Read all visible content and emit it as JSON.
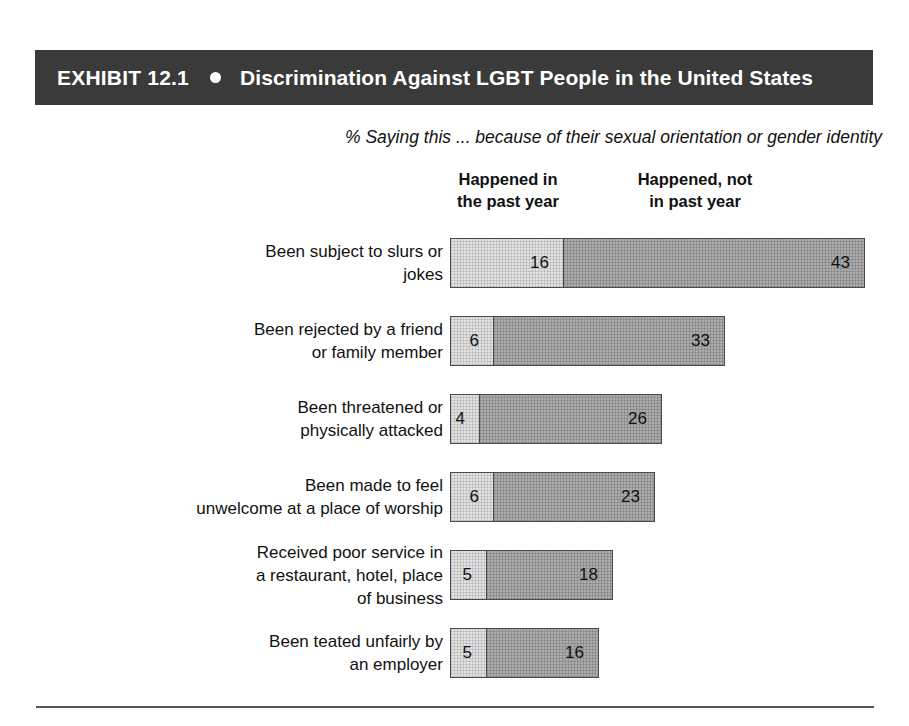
{
  "header": {
    "exhibit_label": "EXHIBIT 12.1",
    "bullet_icon": "bullet-dot-icon",
    "title": "Discrimination Against LGBT People in the United States",
    "bar_color": "#3a3a3a",
    "text_color": "#ffffff"
  },
  "subtitle": "% Saying this ... because of their sexual orientation or gender identity",
  "columns": [
    {
      "line1": "Happened in",
      "line2": "the past year"
    },
    {
      "line1": "Happened, not",
      "line2": "in past year"
    }
  ],
  "chart_data": {
    "type": "bar",
    "title": "Discrimination Against LGBT People in the United States",
    "subtitle": "% Saying this ... because of their sexual orientation or gender identity",
    "xlabel": "",
    "ylabel": "",
    "orientation": "horizontal",
    "stacked": true,
    "grid": false,
    "legend_position": "top",
    "units": "percent",
    "px_per_unit": 7,
    "categories": [
      "Been subject to slurs or jokes",
      "Been rejected by a friend or family member",
      "Been threatened or physically attacked",
      "Been made to feel unwelcome at a place of worship",
      "Received poor service in a restaurant, hotel, place of business",
      "Been teated unfairly by an employer"
    ],
    "series": [
      {
        "name": "Happened in the past year",
        "color": "#e2e2e2",
        "values": [
          16,
          6,
          4,
          6,
          5,
          5
        ]
      },
      {
        "name": "Happened, not in past year",
        "color": "#ababab",
        "values": [
          43,
          33,
          26,
          23,
          18,
          16
        ]
      }
    ]
  },
  "rows": [
    {
      "label_lines": [
        "Been subject to slurs or",
        "jokes"
      ],
      "past_year": 16,
      "not_past_year": 43
    },
    {
      "label_lines": [
        "Been rejected by a friend",
        "or family member"
      ],
      "past_year": 6,
      "not_past_year": 33
    },
    {
      "label_lines": [
        "Been threatened or",
        "physically attacked"
      ],
      "past_year": 4,
      "not_past_year": 26
    },
    {
      "label_lines": [
        "Been made to feel",
        "unwelcome at a place of worship"
      ],
      "past_year": 6,
      "not_past_year": 23
    },
    {
      "label_lines": [
        "Received poor service in",
        "a restaurant, hotel, place",
        "of business"
      ],
      "past_year": 5,
      "not_past_year": 18
    },
    {
      "label_lines": [
        "Been teated unfairly by",
        "an employer"
      ],
      "past_year": 5,
      "not_past_year": 16
    }
  ]
}
